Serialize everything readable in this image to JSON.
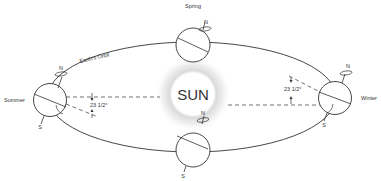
{
  "diagram": {
    "sun_label": "SUN",
    "orbit_label": "Earth's Orbit",
    "seasons": {
      "spring": "Spring",
      "summer": "Summer",
      "winter": "Winter"
    },
    "poles": {
      "north": "N",
      "south": "S"
    },
    "tilt_label": "23 1/2°",
    "colors": {
      "line": "#333333",
      "sun_halo": "#d0d0d0",
      "background": "#ffffff"
    }
  }
}
